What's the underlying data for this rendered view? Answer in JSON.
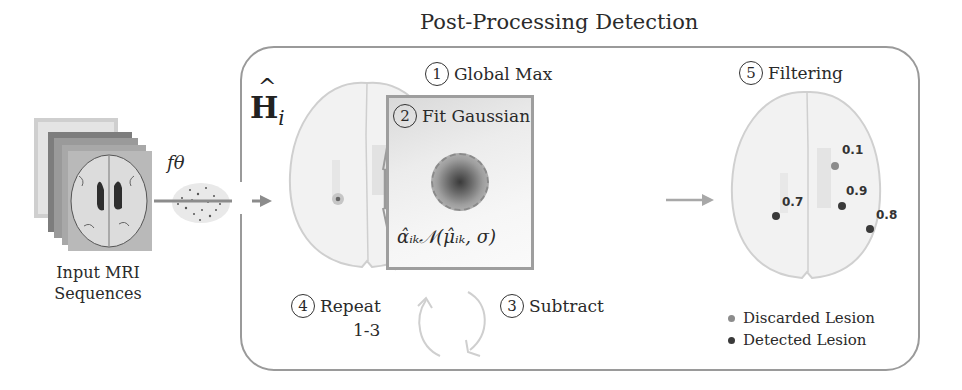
{
  "title": "Post-Processing Detection",
  "input": {
    "caption_line1": "Input MRI",
    "caption_line2": "Sequences",
    "model_label": "fθ"
  },
  "heatmap": {
    "label": "H",
    "label_hat": "^",
    "label_sub": "i"
  },
  "steps": [
    {
      "number": "1",
      "label": "Global Max"
    },
    {
      "number": "2",
      "label": "Fit Gaussian"
    },
    {
      "number": "3",
      "label": "Subtract"
    },
    {
      "number": "4",
      "label": "Repeat",
      "label_line2": "1-3"
    },
    {
      "number": "5",
      "label": "Filtering"
    }
  ],
  "formula": "α̂ᵢₖ𝒩(μ̂ᵢₖ, σ)",
  "lesions": [
    {
      "score": "0.1",
      "status": "discarded"
    },
    {
      "score": "0.7",
      "status": "detected"
    },
    {
      "score": "0.9",
      "status": "detected"
    },
    {
      "score": "0.8",
      "status": "detected"
    }
  ],
  "legend": [
    {
      "label": "Discarded Lesion",
      "color": "#8c8c8c"
    },
    {
      "label": "Detected Lesion",
      "color": "#3a3a3a"
    }
  ],
  "colors": {
    "border": "#9a9a9a",
    "arrow": "#8c8c8c",
    "discarded": "#8c8c8c",
    "detected": "#3a3a3a"
  }
}
